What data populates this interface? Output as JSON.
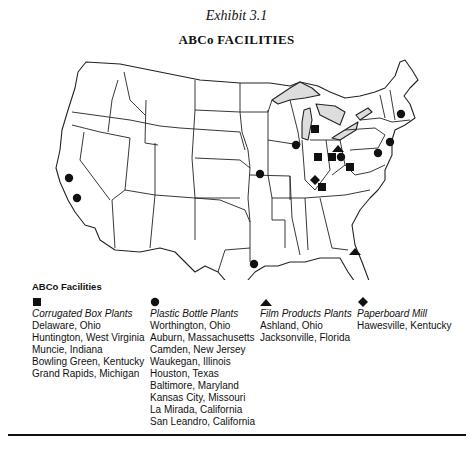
{
  "header": {
    "exhibit": "Exhibit 3.1",
    "title": "ABCo FACILITIES"
  },
  "legend": {
    "title": "ABCo Facilities",
    "categories": [
      {
        "symbol": "square-icon",
        "label": "Corrugated Box Plants",
        "locations": [
          "Delaware, Ohio",
          "Huntington, West Virginia",
          "Muncie, Indiana",
          "Bowling Green, Kentucky",
          "Grand Rapids, Michigan"
        ]
      },
      {
        "symbol": "circle-icon",
        "label": "Plastic Bottle Plants",
        "locations": [
          "Worthington, Ohio",
          "Auburn, Massachusetts",
          "Camden, New Jersey",
          "Waukegan, Illinois",
          "Houston, Texas",
          "Baltimore, Maryland",
          "Kansas City, Missouri",
          "La Mirada, California",
          "San Leandro, California"
        ]
      },
      {
        "symbol": "triangle-icon",
        "label": "Film Products Plants",
        "locations": [
          "Ashland, Ohio",
          "Jacksonville, Florida"
        ]
      },
      {
        "symbol": "diamond-icon",
        "label": "Paperboard Mill",
        "locations": [
          "Hawesville, Kentucky"
        ]
      }
    ]
  },
  "markers": [
    {
      "type": "square",
      "name": "Grand Rapids, Michigan",
      "x": 315,
      "y": 129
    },
    {
      "type": "square",
      "name": "Muncie, Indiana",
      "x": 318,
      "y": 157
    },
    {
      "type": "square",
      "name": "Delaware, Ohio",
      "x": 332,
      "y": 157
    },
    {
      "type": "square",
      "name": "Huntington, West Virginia",
      "x": 350,
      "y": 167
    },
    {
      "type": "square",
      "name": "Bowling Green, Kentucky",
      "x": 322,
      "y": 187
    },
    {
      "type": "circle",
      "name": "Worthington, Ohio",
      "x": 341,
      "y": 157
    },
    {
      "type": "circle",
      "name": "Auburn, Massachusetts",
      "x": 401,
      "y": 114
    },
    {
      "type": "circle",
      "name": "Camden, New Jersey",
      "x": 390,
      "y": 142
    },
    {
      "type": "circle",
      "name": "Waukegan, Illinois",
      "x": 296,
      "y": 145
    },
    {
      "type": "circle",
      "name": "Houston, Texas",
      "x": 254,
      "y": 264
    },
    {
      "type": "circle",
      "name": "Baltimore, Maryland",
      "x": 378,
      "y": 153
    },
    {
      "type": "circle",
      "name": "Kansas City, Missouri",
      "x": 260,
      "y": 174
    },
    {
      "type": "circle",
      "name": "La Mirada, California",
      "x": 77,
      "y": 198
    },
    {
      "type": "circle",
      "name": "San Leandro, California",
      "x": 69,
      "y": 178
    },
    {
      "type": "triangle",
      "name": "Ashland, Ohio",
      "x": 338,
      "y": 149
    },
    {
      "type": "triangle",
      "name": "Jacksonville, Florida",
      "x": 355,
      "y": 252
    },
    {
      "type": "diamond",
      "name": "Hawesville, Kentucky",
      "x": 315,
      "y": 180
    }
  ]
}
